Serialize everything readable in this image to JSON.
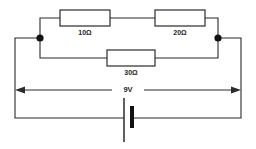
{
  "diagram": {
    "background_color": "#ffffff",
    "line_color": "#2b2b2b"
  },
  "source": {
    "label": "9V",
    "type": "battery",
    "voltage_value": 9,
    "voltage_unit": "V"
  },
  "resistors": [
    {
      "id": "r1",
      "label": "10Ω",
      "value": 10,
      "unit": "Ω",
      "branch": "top",
      "position": "left"
    },
    {
      "id": "r2",
      "label": "20Ω",
      "value": 20,
      "unit": "Ω",
      "branch": "top",
      "position": "right"
    },
    {
      "id": "r3",
      "label": "30Ω",
      "value": 30,
      "unit": "Ω",
      "branch": "middle",
      "position": "center"
    }
  ],
  "nodes": [
    {
      "id": "node-left",
      "label": ""
    },
    {
      "id": "node-right",
      "label": ""
    }
  ]
}
